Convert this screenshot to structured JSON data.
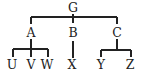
{
  "diagram": {
    "type": "tree",
    "colors": {
      "ink": "#222222",
      "background": "#ffffff"
    },
    "nodes": [
      {
        "id": "G",
        "label": "G",
        "x": 73,
        "y": 8
      },
      {
        "id": "A",
        "label": "A",
        "x": 31,
        "y": 33
      },
      {
        "id": "B",
        "label": "B",
        "x": 73,
        "y": 33
      },
      {
        "id": "C",
        "label": "C",
        "x": 117,
        "y": 33
      },
      {
        "id": "U",
        "label": "U",
        "x": 12,
        "y": 65
      },
      {
        "id": "V",
        "label": "V",
        "x": 31,
        "y": 65
      },
      {
        "id": "W",
        "label": "W",
        "x": 47,
        "y": 65
      },
      {
        "id": "X",
        "label": "X",
        "x": 72,
        "y": 65
      },
      {
        "id": "Y",
        "label": "Y",
        "x": 101,
        "y": 65
      },
      {
        "id": "Z",
        "label": "Z",
        "x": 130,
        "y": 65
      }
    ],
    "edges": [
      {
        "from": "G",
        "to": "A"
      },
      {
        "from": "G",
        "to": "B"
      },
      {
        "from": "G",
        "to": "C"
      },
      {
        "from": "A",
        "to": "U"
      },
      {
        "from": "A",
        "to": "V"
      },
      {
        "from": "A",
        "to": "W"
      },
      {
        "from": "B",
        "to": "X"
      },
      {
        "from": "C",
        "to": "Y"
      },
      {
        "from": "C",
        "to": "Z"
      }
    ]
  }
}
